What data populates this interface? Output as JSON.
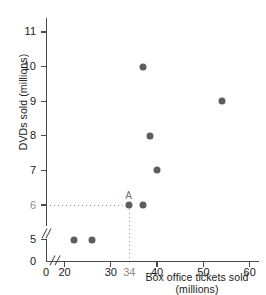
{
  "chart_data": {
    "type": "scatter",
    "title": "",
    "xlabel": "Box office tickets sold (millions)",
    "ylabel": "DVDs sold (millions)",
    "xlim": [
      16,
      62
    ],
    "ylim": [
      4.4,
      11.4
    ],
    "grid": false,
    "legend": null,
    "axis_break_x": true,
    "axis_break_y": true,
    "x_ticks": [
      {
        "value": 0,
        "label": "0"
      },
      {
        "value": 20,
        "label": "20"
      },
      {
        "value": 30,
        "label": "30"
      },
      {
        "value": 34,
        "label": "34",
        "muted": true
      },
      {
        "value": 40,
        "label": "40"
      },
      {
        "value": 50,
        "label": "50"
      },
      {
        "value": 60,
        "label": "60"
      }
    ],
    "y_ticks": [
      {
        "value": 0,
        "label": "0"
      },
      {
        "value": 5,
        "label": "5"
      },
      {
        "value": 6,
        "label": "6",
        "muted": true
      },
      {
        "value": 7,
        "label": "7"
      },
      {
        "value": 8,
        "label": "8"
      },
      {
        "value": 9,
        "label": "9"
      },
      {
        "value": 10,
        "label": "10"
      },
      {
        "value": 11,
        "label": "11"
      }
    ],
    "points": [
      {
        "x": 22,
        "y": 5,
        "label": ""
      },
      {
        "x": 26,
        "y": 5,
        "label": ""
      },
      {
        "x": 34,
        "y": 6,
        "label": "A"
      },
      {
        "x": 37,
        "y": 6,
        "label": ""
      },
      {
        "x": 37,
        "y": 10,
        "label": ""
      },
      {
        "x": 38.5,
        "y": 8,
        "label": ""
      },
      {
        "x": 40,
        "y": 7,
        "label": ""
      },
      {
        "x": 54,
        "y": 9,
        "label": ""
      }
    ],
    "annotations": [
      {
        "name": "point-a",
        "label": "A",
        "x": 34,
        "y": 6,
        "guide_x_label": "34",
        "guide_y_label": "6"
      }
    ],
    "colors": {
      "point": "#5d5d5d",
      "axis": "#4a4a4a",
      "guide": "#9a9a9a",
      "muted_text": "#8e8e8e",
      "text": "#1a1a1a",
      "background": "#ffffff"
    }
  }
}
